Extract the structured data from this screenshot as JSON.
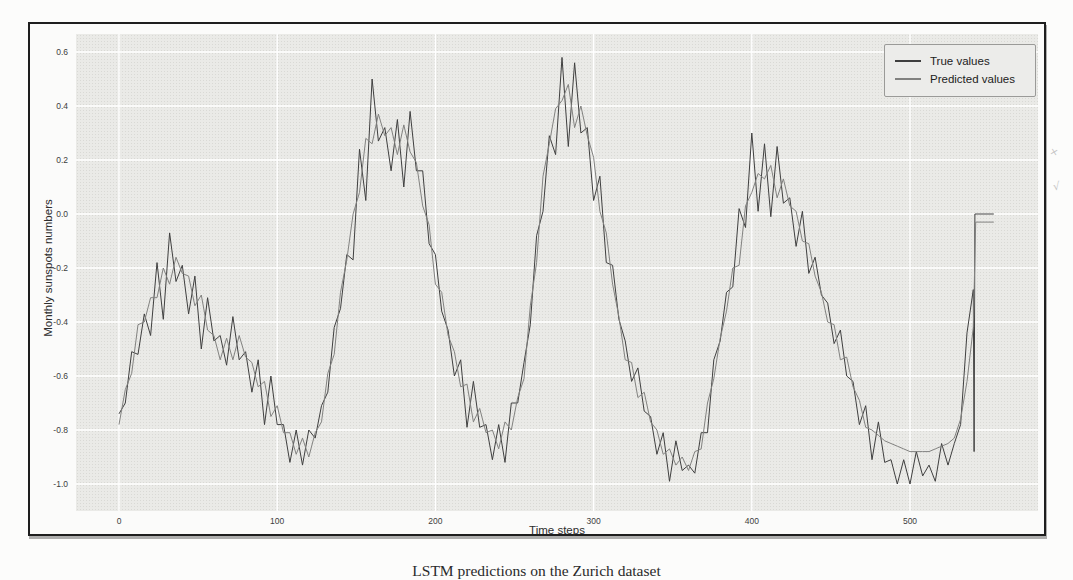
{
  "figure": {
    "ylabel": "Monthly sunspots numbers",
    "xlabel": "Time steps",
    "caption": "LSTM predictions on the Zurich dataset",
    "margin_marks": [
      "×",
      "√"
    ],
    "legend": [
      {
        "label": "True values",
        "color": "#3f3f3f"
      },
      {
        "label": "Predicted values",
        "color": "#828280"
      }
    ],
    "x_tick_labels": [
      "0",
      "100",
      "200",
      "300",
      "400",
      "500"
    ],
    "y_tick_labels": [
      "0.6",
      "0.4",
      "0.2",
      "0.0",
      "-0.2",
      "-0.4",
      "-0.6",
      "-0.8",
      "-1.0"
    ],
    "panel_bg": "#eaeae7",
    "grid_color": "#ffffff",
    "frame_color": "#1e1e1e"
  },
  "chart_data": {
    "type": "line",
    "title": "",
    "xlabel": "Time steps",
    "ylabel": "Monthly sunspots numbers",
    "xlim": [
      -27,
      581
    ],
    "ylim": [
      -1.1,
      0.67
    ],
    "grid": true,
    "legend_position": "upper right",
    "x_tick_values": [
      0,
      100,
      200,
      300,
      400,
      500
    ],
    "y_tick_values": [
      0.6,
      0.4,
      0.2,
      0.0,
      -0.2,
      -0.4,
      -0.6,
      -0.8,
      -1.0
    ],
    "x_start": 0,
    "x_step": 4,
    "series": [
      {
        "name": "True values",
        "color": "#3f3f3f",
        "values": [
          -0.74,
          -0.7,
          -0.51,
          -0.52,
          -0.37,
          -0.45,
          -0.18,
          -0.39,
          -0.07,
          -0.25,
          -0.19,
          -0.37,
          -0.23,
          -0.5,
          -0.31,
          -0.47,
          -0.45,
          -0.56,
          -0.38,
          -0.54,
          -0.51,
          -0.66,
          -0.54,
          -0.78,
          -0.6,
          -0.78,
          -0.78,
          -0.92,
          -0.8,
          -0.93,
          -0.8,
          -0.83,
          -0.71,
          -0.66,
          -0.42,
          -0.35,
          -0.15,
          -0.17,
          0.24,
          0.05,
          0.5,
          0.27,
          0.32,
          0.16,
          0.35,
          0.1,
          0.38,
          0.16,
          0.16,
          -0.11,
          -0.15,
          -0.36,
          -0.43,
          -0.6,
          -0.54,
          -0.79,
          -0.62,
          -0.79,
          -0.78,
          -0.91,
          -0.78,
          -0.92,
          -0.7,
          -0.7,
          -0.55,
          -0.41,
          -0.08,
          0.01,
          0.29,
          0.22,
          0.58,
          0.25,
          0.56,
          0.3,
          0.32,
          0.05,
          0.14,
          -0.18,
          -0.19,
          -0.39,
          -0.47,
          -0.62,
          -0.57,
          -0.73,
          -0.75,
          -0.89,
          -0.81,
          -0.99,
          -0.84,
          -0.95,
          -0.93,
          -0.96,
          -0.81,
          -0.81,
          -0.54,
          -0.47,
          -0.29,
          -0.27,
          0.02,
          -0.05,
          0.3,
          0.01,
          0.26,
          -0.01,
          0.25,
          0.04,
          0.06,
          -0.12,
          0.01,
          -0.22,
          -0.16,
          -0.3,
          -0.33,
          -0.48,
          -0.43,
          -0.6,
          -0.62,
          -0.78,
          -0.71,
          -0.91,
          -0.77,
          -0.92,
          -0.91,
          -1.0,
          -0.91,
          -1.0,
          -0.88,
          -0.97,
          -0.93,
          -0.99,
          -0.85,
          -0.93,
          -0.85,
          -0.78,
          -0.44,
          -0.28
        ],
        "tail": [
          [
            540,
            -0.28
          ],
          [
            540.5,
            -0.88
          ],
          [
            541,
            0.0
          ],
          [
            553,
            0.0
          ]
        ]
      },
      {
        "name": "Predicted values",
        "color": "#828280",
        "values": [
          -0.78,
          -0.65,
          -0.59,
          -0.41,
          -0.4,
          -0.31,
          -0.31,
          -0.2,
          -0.26,
          -0.16,
          -0.22,
          -0.23,
          -0.34,
          -0.3,
          -0.43,
          -0.45,
          -0.54,
          -0.46,
          -0.54,
          -0.45,
          -0.53,
          -0.55,
          -0.64,
          -0.62,
          -0.75,
          -0.71,
          -0.81,
          -0.81,
          -0.89,
          -0.83,
          -0.9,
          -0.81,
          -0.77,
          -0.59,
          -0.52,
          -0.29,
          -0.17,
          0.0,
          0.08,
          0.28,
          0.26,
          0.37,
          0.29,
          0.32,
          0.22,
          0.33,
          0.23,
          0.19,
          0.03,
          -0.04,
          -0.26,
          -0.29,
          -0.45,
          -0.51,
          -0.64,
          -0.63,
          -0.77,
          -0.72,
          -0.81,
          -0.8,
          -0.87,
          -0.77,
          -0.8,
          -0.68,
          -0.61,
          -0.34,
          -0.18,
          0.14,
          0.26,
          0.39,
          0.42,
          0.48,
          0.32,
          0.4,
          0.29,
          0.21,
          0.01,
          -0.07,
          -0.26,
          -0.38,
          -0.54,
          -0.55,
          -0.68,
          -0.66,
          -0.77,
          -0.8,
          -0.89,
          -0.87,
          -0.93,
          -0.9,
          -0.95,
          -0.88,
          -0.87,
          -0.7,
          -0.61,
          -0.46,
          -0.36,
          -0.2,
          -0.19,
          0.03,
          0.08,
          0.15,
          0.13,
          0.18,
          0.06,
          0.13,
          0.03,
          0.01,
          -0.1,
          -0.11,
          -0.23,
          -0.29,
          -0.4,
          -0.41,
          -0.54,
          -0.53,
          -0.64,
          -0.69,
          -0.79,
          -0.8,
          -0.82,
          -0.84,
          -0.85,
          -0.86,
          -0.87,
          -0.88,
          -0.88,
          -0.88,
          -0.88,
          -0.87,
          -0.86,
          -0.85,
          -0.83,
          -0.76,
          -0.62,
          -0.42
        ],
        "tail": [
          [
            540,
            -0.42
          ],
          [
            541.5,
            -0.03
          ],
          [
            553,
            -0.03
          ]
        ]
      }
    ]
  }
}
